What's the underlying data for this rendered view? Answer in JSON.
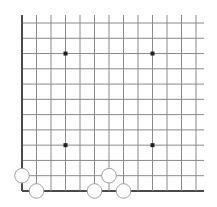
{
  "board": {
    "cols": 13,
    "rows": 12,
    "origin_x": 22,
    "origin_y": 23,
    "spacing_x": 14.5,
    "spacing_y": 15.27,
    "top_extend_to": 15,
    "right_extend_to": 204,
    "line_color": "#8a8a8a",
    "border_color": "#4a4a4a",
    "star_color": "#222222",
    "star_points": [
      {
        "col": 3,
        "row": 2
      },
      {
        "col": 9,
        "row": 2
      },
      {
        "col": 3,
        "row": 8
      },
      {
        "col": 9,
        "row": 8
      }
    ],
    "stones": [
      {
        "col": 0,
        "row": 10,
        "color": "white"
      },
      {
        "col": 1,
        "row": 11,
        "color": "white"
      },
      {
        "col": 5,
        "row": 11,
        "color": "white"
      },
      {
        "col": 6,
        "row": 10,
        "color": "white"
      },
      {
        "col": 7,
        "row": 11,
        "color": "white"
      }
    ],
    "stone_fill": "#ffffff",
    "stone_stroke": "#a0a0a0",
    "stone_radius": 7.3
  }
}
